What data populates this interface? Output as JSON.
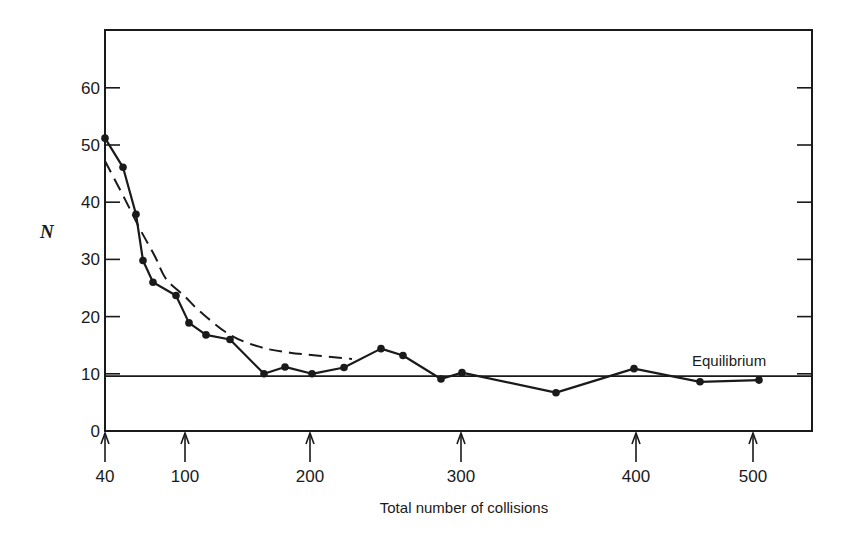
{
  "chart_data": {
    "type": "line",
    "title": "",
    "xlabel": "Total number of collisions",
    "ylabel": "N",
    "ylim": [
      0,
      70
    ],
    "y_ticks": [
      0,
      10,
      20,
      30,
      40,
      50,
      60
    ],
    "x_ticks": [
      {
        "label": "40",
        "value": 40,
        "x_px": 105
      },
      {
        "label": "100",
        "value": 100,
        "x_px": 185
      },
      {
        "label": "200",
        "value": 200,
        "x_px": 310
      },
      {
        "label": "300",
        "value": 300,
        "x_px": 461
      },
      {
        "label": "400",
        "value": 400,
        "x_px": 636
      },
      {
        "label": "500",
        "value": 500,
        "x_px": 753
      }
    ],
    "x_tick_style": "upward arrows below axis",
    "grid": false,
    "series": [
      {
        "name": "Observed N",
        "style": "solid line with filled circle markers",
        "points": [
          {
            "x": 40,
            "y": 51.2,
            "x_px": 105
          },
          {
            "x": 54,
            "y": 46.1,
            "x_px": 123
          },
          {
            "x": 63,
            "y": 37.9,
            "x_px": 136
          },
          {
            "x": 69,
            "y": 29.8,
            "x_px": 143
          },
          {
            "x": 76,
            "y": 26.0,
            "x_px": 153
          },
          {
            "x": 93,
            "y": 23.7,
            "x_px": 176
          },
          {
            "x": 103,
            "y": 18.9,
            "x_px": 189
          },
          {
            "x": 117,
            "y": 16.8,
            "x_px": 206
          },
          {
            "x": 136,
            "y": 16.0,
            "x_px": 230
          },
          {
            "x": 163,
            "y": 10.0,
            "x_px": 264
          },
          {
            "x": 180,
            "y": 11.2,
            "x_px": 285
          },
          {
            "x": 201,
            "y": 10.0,
            "x_px": 312
          },
          {
            "x": 223,
            "y": 11.1,
            "x_px": 344
          },
          {
            "x": 247,
            "y": 14.4,
            "x_px": 381
          },
          {
            "x": 262,
            "y": 13.2,
            "x_px": 403
          },
          {
            "x": 287,
            "y": 9.1,
            "x_px": 441
          },
          {
            "x": 301,
            "y": 10.2,
            "x_px": 462
          },
          {
            "x": 354,
            "y": 6.7,
            "x_px": 556
          },
          {
            "x": 399,
            "y": 10.9,
            "x_px": 634
          },
          {
            "x": 455,
            "y": 8.6,
            "x_px": 700
          },
          {
            "x": 505,
            "y": 8.9,
            "x_px": 759
          }
        ]
      },
      {
        "name": "Theoretical decay",
        "style": "dashed curve",
        "points": [
          {
            "x": 40,
            "y": 47.2,
            "x_px": 105
          },
          {
            "x": 56,
            "y": 40.5,
            "x_px": 125
          },
          {
            "x": 66,
            "y": 35.3,
            "x_px": 140
          },
          {
            "x": 79,
            "y": 30.5,
            "x_px": 155
          },
          {
            "x": 88,
            "y": 26.6,
            "x_px": 166
          },
          {
            "x": 100,
            "y": 23.5,
            "x_px": 185
          },
          {
            "x": 112,
            "y": 20.9,
            "x_px": 200
          },
          {
            "x": 136,
            "y": 16.8,
            "x_px": 230
          },
          {
            "x": 160,
            "y": 14.7,
            "x_px": 260
          },
          {
            "x": 184,
            "y": 13.7,
            "x_px": 290
          },
          {
            "x": 228,
            "y": 12.6,
            "x_px": 352
          }
        ]
      },
      {
        "name": "Equilibrium",
        "style": "solid horizontal line",
        "y": 9.6
      }
    ],
    "annotations": [
      {
        "text": "Equilibrium",
        "x_px": 692,
        "y_px": 366
      }
    ]
  },
  "labels": {
    "xlabel": "Total number of collisions",
    "ylabel": "N",
    "equilibrium": "Equilibrium"
  }
}
